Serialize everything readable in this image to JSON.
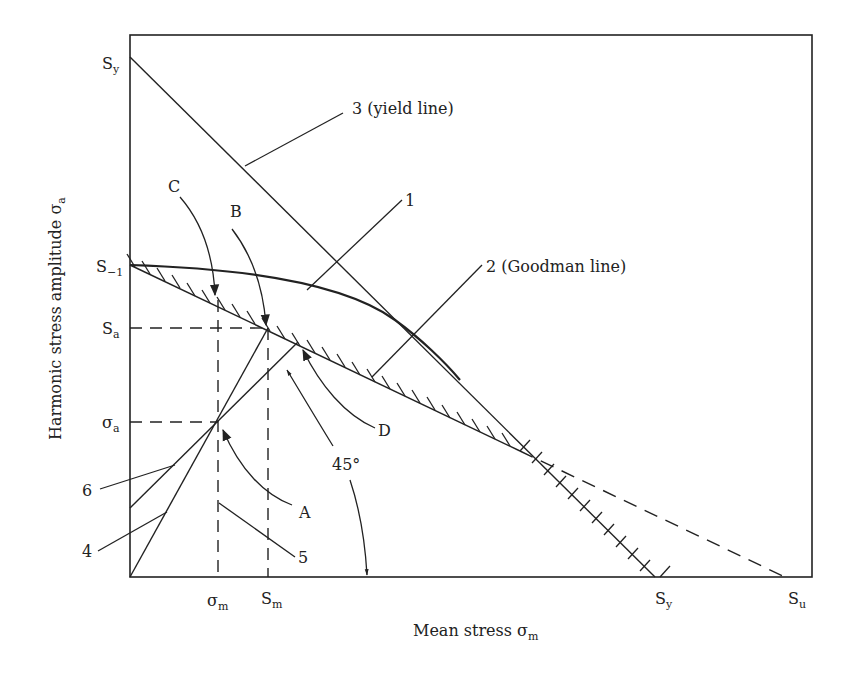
{
  "figure": {
    "type": "fatigue-diagram",
    "x_axis": {
      "title": "Mean stress",
      "symbol": "σ",
      "symbol_sub": "m"
    },
    "y_axis": {
      "title": "Harmonic stress amplitude",
      "symbol": "σ",
      "symbol_sub": "a"
    },
    "y_ticks": [
      {
        "id": "Sy",
        "main": "S",
        "sub": "y"
      },
      {
        "id": "S-1",
        "main": "S",
        "sub": "−1"
      },
      {
        "id": "Sa",
        "main": "S",
        "sub": "a"
      },
      {
        "id": "sigma-a",
        "main": "σ",
        "sub": "a"
      }
    ],
    "x_ticks": [
      {
        "id": "sigma-m",
        "main": "σ",
        "sub": "m"
      },
      {
        "id": "Sm",
        "main": "S",
        "sub": "m"
      },
      {
        "id": "Sy",
        "main": "S",
        "sub": "y"
      },
      {
        "id": "Su",
        "main": "S",
        "sub": "u"
      }
    ],
    "curve_labels": {
      "yield": "3 (yield line)",
      "curve1": "1",
      "goodman": "2 (Goodman line)",
      "line4": "4",
      "line5": "5",
      "line6": "6"
    },
    "point_labels": {
      "A": "A",
      "B": "B",
      "C": "C",
      "D": "D"
    },
    "angle_label": "45°",
    "colors": {
      "ink": "#222222",
      "background": "#ffffff"
    }
  }
}
